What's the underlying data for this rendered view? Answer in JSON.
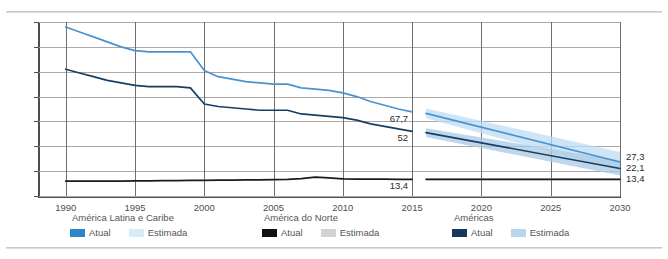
{
  "chart_data": {
    "type": "line",
    "title": "",
    "xlabel": "",
    "ylabel": "",
    "xlim": [
      1988,
      2030
    ],
    "ylim": [
      0,
      140
    ],
    "yticks": [
      0,
      20,
      40,
      60,
      80,
      100,
      120,
      140
    ],
    "xticks": [
      1990,
      1995,
      2000,
      2005,
      2010,
      2015,
      2020,
      2025,
      2030
    ],
    "grid": true,
    "legend_position": "bottom",
    "decimal_separator": ",",
    "series": [
      {
        "name": "América Latina e Caribe",
        "kind": "atual",
        "color": "#4a93cf",
        "x": [
          1990,
          1991,
          1992,
          1993,
          1994,
          1995,
          1996,
          1997,
          1998,
          1999,
          2000,
          2001,
          2002,
          2003,
          2004,
          2005,
          2006,
          2007,
          2008,
          2009,
          2010,
          2011,
          2012,
          2013,
          2014,
          2015
        ],
        "values": [
          136,
          132,
          128,
          124,
          120,
          117,
          116,
          116,
          116,
          116,
          101,
          96,
          94,
          92,
          91,
          90,
          90,
          87,
          86,
          85,
          83,
          80,
          76,
          73,
          70,
          67.7
        ]
      },
      {
        "name": "Américas",
        "kind": "atual",
        "color": "#173f63",
        "x": [
          1990,
          1991,
          1992,
          1993,
          1994,
          1995,
          1996,
          1997,
          1998,
          1999,
          2000,
          2001,
          2002,
          2003,
          2004,
          2005,
          2006,
          2007,
          2008,
          2009,
          2010,
          2011,
          2012,
          2013,
          2014,
          2015
        ],
        "values": [
          102,
          99,
          96,
          93,
          91,
          89,
          88,
          88,
          88,
          87,
          74,
          72,
          71,
          70,
          69,
          69,
          69,
          66,
          65,
          64,
          63,
          61,
          58,
          56,
          54,
          52
        ]
      },
      {
        "name": "América do Norte",
        "kind": "atual",
        "color": "#1a1a1a",
        "x": [
          1990,
          1991,
          1992,
          1993,
          1994,
          1995,
          1996,
          1997,
          1998,
          1999,
          2000,
          2001,
          2002,
          2003,
          2004,
          2005,
          2006,
          2007,
          2008,
          2009,
          2010,
          2011,
          2012,
          2013,
          2014,
          2015
        ],
        "values": [
          12,
          12,
          12,
          12,
          12,
          12.1,
          12.2,
          12.3,
          12.4,
          12.5,
          12.6,
          12.7,
          12.8,
          12.9,
          13,
          13.1,
          13.3,
          14,
          15.2,
          14.6,
          13.8,
          13.6,
          13.5,
          13.5,
          13.4,
          13.4
        ]
      },
      {
        "name": "América Latina e Caribe",
        "kind": "estimada",
        "color": "#4a93cf",
        "band_color": "#bcdcf3",
        "x": [
          2016,
          2030
        ],
        "values": [
          66.5,
          27.3
        ],
        "band_upper": [
          70.5,
          35.5
        ],
        "band_lower": [
          62.5,
          20.5
        ]
      },
      {
        "name": "Américas",
        "kind": "estimada",
        "color": "#173f63",
        "band_color": "#a9c9e4",
        "x": [
          2016,
          2030
        ],
        "values": [
          51.0,
          22.1
        ],
        "band_upper": [
          54.5,
          28.5
        ],
        "band_lower": [
          47.5,
          16.5
        ]
      },
      {
        "name": "América do Norte",
        "kind": "estimada",
        "color": "#1a1a1a",
        "band_color": "#cfcfcf",
        "x": [
          2016,
          2030
        ],
        "values": [
          13.4,
          13.4
        ],
        "band_upper": [
          14.2,
          14.2
        ],
        "band_lower": [
          12.6,
          12.6
        ]
      }
    ],
    "annotations": [
      {
        "text": "67,7",
        "value": 67.7,
        "at": "2015",
        "position": "left-of-forecast"
      },
      {
        "text": "52",
        "value": 52,
        "at": "2015",
        "position": "left-of-forecast"
      },
      {
        "text": "13,4",
        "value": 13.4,
        "at": "2015",
        "position": "left-of-forecast"
      },
      {
        "text": "27,3",
        "value": 27.3,
        "at": "2030",
        "position": "right-end"
      },
      {
        "text": "22,1",
        "value": 22.1,
        "at": "2030",
        "position": "right-end"
      },
      {
        "text": "13,4",
        "value": 13.4,
        "at": "2030",
        "position": "right-end"
      }
    ]
  },
  "legend": {
    "groups": [
      {
        "title": "América Latina e Caribe",
        "items": [
          {
            "label": "Atual",
            "color": "#2e86c8"
          },
          {
            "label": "Estimada",
            "color": "#d8eaf7"
          }
        ]
      },
      {
        "title": "América do Norte",
        "items": [
          {
            "label": "Atual",
            "color": "#111111"
          },
          {
            "label": "Estimada",
            "color": "#d2d2d2"
          }
        ]
      },
      {
        "title": "Américas",
        "items": [
          {
            "label": "Atual",
            "color": "#14395c"
          },
          {
            "label": "Estimada",
            "color": "#b9d5ec"
          }
        ]
      }
    ]
  }
}
